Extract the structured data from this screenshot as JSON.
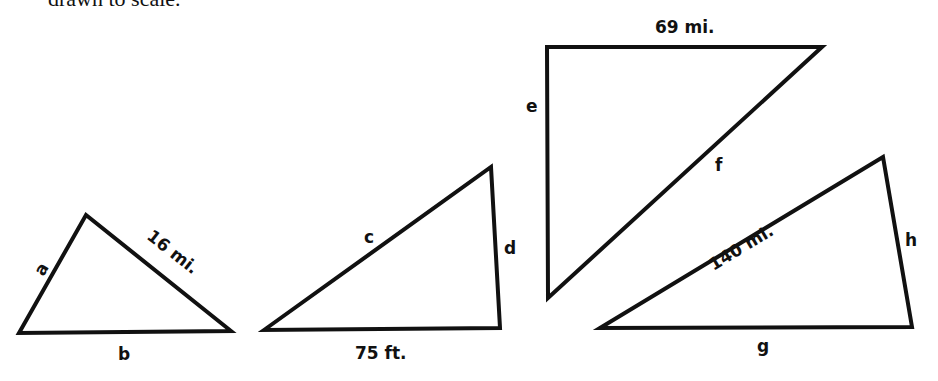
{
  "caption": "drawn to scale.",
  "triangles": [
    {
      "id": "triangle-1",
      "vertices": [
        [
          19,
          333
        ],
        [
          86,
          215
        ],
        [
          231,
          331
        ]
      ],
      "sides": [
        {
          "name": "a",
          "label": "a"
        },
        {
          "name": "hypotenuse",
          "label": "16 mi."
        },
        {
          "name": "b",
          "label": "b"
        }
      ]
    },
    {
      "id": "triangle-2",
      "vertices": [
        [
          264,
          330
        ],
        [
          491,
          167
        ],
        [
          500,
          328
        ]
      ],
      "sides": [
        {
          "name": "c",
          "label": "c"
        },
        {
          "name": "d",
          "label": "d"
        },
        {
          "name": "base",
          "label": "75 ft."
        }
      ]
    },
    {
      "id": "triangle-3",
      "vertices": [
        [
          547,
          47
        ],
        [
          822,
          47
        ],
        [
          548,
          298
        ]
      ],
      "sides": [
        {
          "name": "top",
          "label": "69 mi."
        },
        {
          "name": "e",
          "label": "e"
        },
        {
          "name": "f",
          "label": "f"
        }
      ]
    },
    {
      "id": "triangle-4",
      "vertices": [
        [
          600,
          328
        ],
        [
          883,
          157
        ],
        [
          912,
          327
        ]
      ],
      "sides": [
        {
          "name": "hypotenuse",
          "label": "140 mi."
        },
        {
          "name": "h",
          "label": "h"
        },
        {
          "name": "g",
          "label": "g"
        }
      ]
    }
  ]
}
